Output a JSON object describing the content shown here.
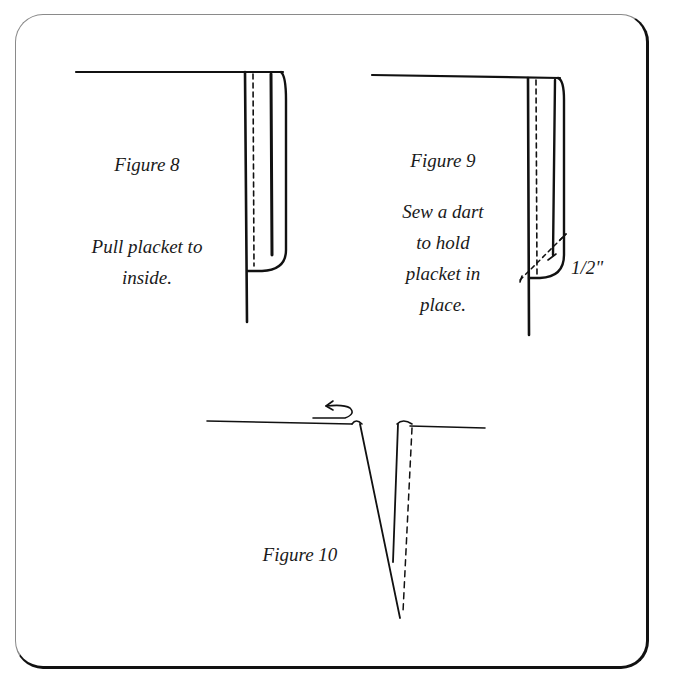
{
  "figures": [
    {
      "id": "figure-8",
      "title": "Figure 8",
      "caption_lines": [
        "Pull placket to",
        "inside."
      ]
    },
    {
      "id": "figure-9",
      "title": "Figure 9",
      "caption_lines": [
        "Sew a dart",
        "to hold",
        "placket in",
        "place."
      ],
      "measurement_label": "1/2\""
    },
    {
      "id": "figure-10",
      "title": "Figure 10",
      "icons": [
        "fold-arrow-icon"
      ]
    }
  ],
  "colors": {
    "ink": "#111111",
    "border_light": "#8a8a8a",
    "background": "#ffffff"
  }
}
